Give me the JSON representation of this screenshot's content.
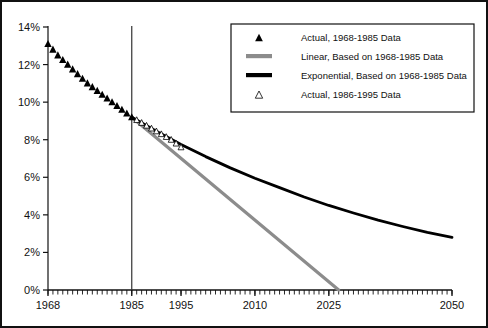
{
  "chart_data": {
    "type": "line",
    "title": "",
    "xlabel": "",
    "ylabel": "",
    "xlim": [
      1968,
      2050
    ],
    "ylim": [
      0,
      14
    ],
    "grid": false,
    "ytick_labels": [
      "0%",
      "2%",
      "4%",
      "6%",
      "8%",
      "10%",
      "12%",
      "14%"
    ],
    "ytick_values": [
      0,
      2,
      4,
      6,
      8,
      10,
      12,
      14
    ],
    "xtick_labels": [
      "1968",
      "1985",
      "1995",
      "2010",
      "2025",
      "2050"
    ],
    "xtick_values": [
      1968,
      1985,
      1995,
      2010,
      2025,
      2050
    ],
    "minor_xticks_interval": 1,
    "annotations": {
      "vertical_rule_year": 1985,
      "vertical_rule_label": "1985"
    },
    "legend": {
      "position": "top-right",
      "entries": [
        {
          "marker": "filled-triangle",
          "label": "Actual, 1968-1985 Data",
          "color": "#000000"
        },
        {
          "marker": "thick-line",
          "label": "Linear, Based on 1968-1985 Data",
          "color": "#8c8c8c"
        },
        {
          "marker": "thick-line",
          "label": "Exponential, Based on 1968-1985 Data",
          "color": "#000000"
        },
        {
          "marker": "hollow-triangle",
          "label": "Actual, 1986-1995 Data",
          "color": "#000000"
        }
      ]
    },
    "series": [
      {
        "name": "Actual, 1968-1985 Data",
        "marker": "filled-triangle",
        "color": "#000000",
        "x": [
          1968,
          1969,
          1970,
          1971,
          1972,
          1973,
          1974,
          1975,
          1976,
          1977,
          1978,
          1979,
          1980,
          1981,
          1982,
          1983,
          1984,
          1985
        ],
        "values": [
          13.1,
          12.8,
          12.5,
          12.25,
          12.0,
          11.75,
          11.5,
          11.25,
          11.0,
          10.8,
          10.6,
          10.4,
          10.2,
          10.0,
          9.8,
          9.6,
          9.4,
          9.2
        ]
      },
      {
        "name": "Actual, 1986-1995 Data",
        "marker": "hollow-triangle",
        "color": "#000000",
        "x": [
          1986,
          1987,
          1988,
          1989,
          1990,
          1991,
          1992,
          1993,
          1994,
          1995
        ],
        "values": [
          9.05,
          8.9,
          8.75,
          8.6,
          8.45,
          8.3,
          8.15,
          8.0,
          7.8,
          7.6
        ]
      },
      {
        "name": "Linear, Based on 1968-1985 Data",
        "marker": "line",
        "color": "#8c8c8c",
        "x": [
          1985,
          2027
        ],
        "values": [
          9.2,
          0.0
        ]
      },
      {
        "name": "Exponential, Based on 1968-1985 Data",
        "marker": "line",
        "color": "#000000",
        "x": [
          1985,
          1990,
          1995,
          2000,
          2005,
          2010,
          2015,
          2020,
          2025,
          2030,
          2035,
          2040,
          2045,
          2050
        ],
        "values": [
          9.2,
          8.45,
          7.75,
          7.1,
          6.5,
          5.95,
          5.45,
          4.95,
          4.5,
          4.1,
          3.72,
          3.38,
          3.07,
          2.8
        ]
      }
    ]
  }
}
